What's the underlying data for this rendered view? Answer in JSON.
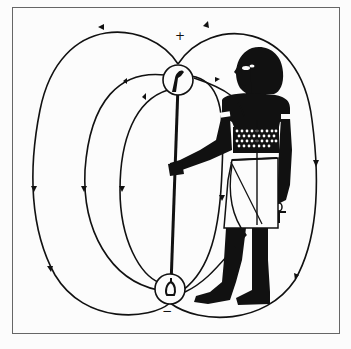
{
  "diagram": {
    "type": "field-lines-illustration",
    "poles": {
      "top": {
        "sign": "+",
        "label": "positive-pole"
      },
      "bottom": {
        "sign": "−",
        "label": "negative-pole"
      }
    },
    "held_object": "ankh",
    "colors": {
      "background": "#fcfcfc",
      "ink": "#111111",
      "frame": "#555555"
    }
  }
}
